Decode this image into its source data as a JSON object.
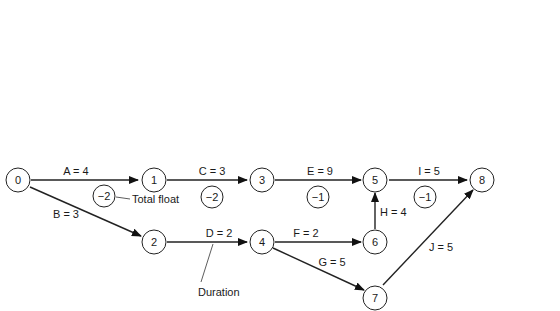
{
  "diagram": {
    "type": "activity-on-arrow network with early/late times and float",
    "nodes": [
      {
        "id": "0",
        "label": "0",
        "x": 18,
        "y": 123,
        "times": [
          "0",
          "-2"
        ],
        "box": {
          "x": 2,
          "y": 60,
          "pos": "above"
        }
      },
      {
        "id": "1",
        "label": "1",
        "x": 154,
        "y": 123,
        "times": [
          "4",
          "2"
        ],
        "box": {
          "x": 138,
          "y": 60,
          "pos": "above"
        }
      },
      {
        "id": "2",
        "label": "2",
        "x": 154,
        "y": 155,
        "times": [
          "3",
          "7"
        ],
        "box": {
          "x": 138,
          "y": 172,
          "pos": "below"
        }
      },
      {
        "id": "3",
        "label": "3",
        "x": 262,
        "y": 123,
        "times": [
          "7",
          "5"
        ],
        "box": {
          "x": 244,
          "y": 60,
          "pos": "above"
        }
      },
      {
        "id": "4",
        "label": "4",
        "x": 262,
        "y": 155,
        "times": [
          "5",
          "9"
        ],
        "box": {
          "x": 244,
          "y": 172,
          "pos": "below"
        }
      },
      {
        "id": "5",
        "label": "5",
        "x": 376,
        "y": 123,
        "times": [
          "16",
          "15"
        ],
        "box": {
          "x": 356,
          "y": 60,
          "pos": "above"
        }
      },
      {
        "id": "6",
        "label": "6",
        "x": 376,
        "y": 155,
        "times": [
          "7",
          "11"
        ],
        "box": {
          "x": 342,
          "y": 123,
          "pos": "left"
        }
      },
      {
        "id": "7",
        "label": "7",
        "x": 376,
        "y": 215,
        "times": [
          "10",
          "15"
        ],
        "box": {
          "x": 356,
          "y": 232,
          "pos": "below"
        }
      },
      {
        "id": "8",
        "label": "8",
        "x": 482,
        "y": 123,
        "times": [
          "21",
          "20"
        ],
        "box": {
          "x": 464,
          "y": 60,
          "pos": "above"
        }
      }
    ],
    "activities": [
      {
        "id": "A",
        "label": "A = 4",
        "from": "0",
        "to": "1",
        "float": "−2"
      },
      {
        "id": "B",
        "label": "B = 3",
        "from": "0",
        "to": "2"
      },
      {
        "id": "C",
        "label": "C = 3",
        "from": "1",
        "to": "3",
        "float": "−2"
      },
      {
        "id": "D",
        "label": "D = 2",
        "from": "2",
        "to": "4"
      },
      {
        "id": "E",
        "label": "E = 9",
        "from": "3",
        "to": "5",
        "float": "−1"
      },
      {
        "id": "F",
        "label": "F = 2",
        "from": "4",
        "to": "6"
      },
      {
        "id": "G",
        "label": "G = 5",
        "from": "4",
        "to": "7"
      },
      {
        "id": "H",
        "label": "H = 4",
        "from": "6",
        "to": "5"
      },
      {
        "id": "I",
        "label": "I = 5",
        "from": "5",
        "to": "8",
        "float": "−1"
      },
      {
        "id": "J",
        "label": "J = 5",
        "from": "7",
        "to": "8"
      }
    ],
    "node_labels": {
      "n0": "0",
      "n1": "1",
      "n2": "2",
      "n3": "3",
      "n4": "4",
      "n5": "5",
      "n6": "6",
      "n7": "7",
      "n8": "8"
    },
    "time_boxes": {
      "n0": {
        "early": "0",
        "late": "−2"
      },
      "n1": {
        "early": "4",
        "late": "2"
      },
      "n2": {
        "early": "3",
        "late": "7"
      },
      "n3": {
        "early": "7",
        "late": "5"
      },
      "n4": {
        "early": "5",
        "late": "9"
      },
      "n5": {
        "early": "16",
        "late": "15"
      },
      "n6": {
        "early": "7",
        "late": "11"
      },
      "n7": {
        "early": "10",
        "late": "15"
      },
      "n8": {
        "early": "21",
        "late": "20"
      }
    },
    "activity_labels": {
      "A": "A = 4",
      "B": "B = 3",
      "C": "C = 3",
      "D": "D = 2",
      "E": "E = 9",
      "F": "F = 2",
      "G": "G = 5",
      "H": "H = 4",
      "I": "I = 5",
      "J": "J = 5"
    },
    "float_circles": {
      "A": "−2",
      "C": "−2",
      "E": "−1",
      "I": "−1"
    },
    "schedule_dates": {
      "late": {
        "value": "5",
        "caption": "Intermediate schedule date/late"
      },
      "final": {
        "value": "20",
        "caption": "Final schedule date"
      },
      "early": {
        "value": "9",
        "caption": "Intermediate schedule date/early"
      }
    },
    "annotations": {
      "total_float": "Total float",
      "duration": "Duration"
    }
  }
}
